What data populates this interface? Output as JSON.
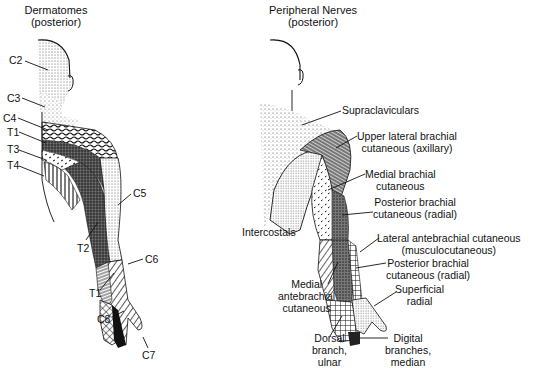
{
  "figures": [
    {
      "id": "dermatomes",
      "title_line1": "Dermatomes",
      "title_line2": "(posterior)",
      "labels": [
        "C2",
        "C3",
        "C4",
        "T1",
        "T3",
        "T4",
        "C5",
        "T2",
        "C6",
        "T1",
        "C8",
        "C7"
      ]
    },
    {
      "id": "peripheral-nerves",
      "title_line1": "Peripheral Nerves",
      "title_line2": "(posterior)",
      "labels": [
        {
          "line1": "Supraclaviculars"
        },
        {
          "line1": "Upper lateral brachial",
          "line2": "cutaneous (axillary)"
        },
        {
          "line1": "Medial brachial",
          "line2": "cutaneous"
        },
        {
          "line1": "Posterior brachial",
          "line2": "cutaneous (radial)"
        },
        {
          "line1": "Intercostals"
        },
        {
          "line1": "Lateral antebrachial cutaneous",
          "line2": "(musculocutaneous)"
        },
        {
          "line1": "Posterior brachial",
          "line2": "cutaneous (radial)"
        },
        {
          "line1": "Medial",
          "line2": "antebrachial",
          "line3": "cutaneous"
        },
        {
          "line1": "Superficial",
          "line2": "radial"
        },
        {
          "line1": "Dorsal",
          "line2": "branch,",
          "line3": "ulnar"
        },
        {
          "line1": "Digital",
          "line2": "branches,",
          "line3": "median"
        }
      ]
    }
  ]
}
